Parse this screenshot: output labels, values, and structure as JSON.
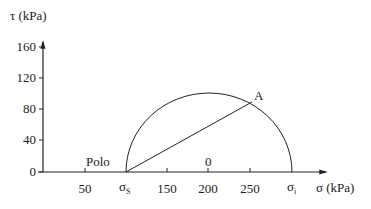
{
  "diagram": {
    "type": "mohr-circle",
    "y_axis": {
      "label": "τ (kPa)",
      "ticks": [
        "0",
        "40",
        "80",
        "120",
        "160"
      ]
    },
    "x_axis": {
      "label": "σ (kPa)",
      "ticks": [
        "50",
        "150",
        "200",
        "250"
      ],
      "special_ticks": {
        "sigma_s": {
          "symbol": "σ",
          "subscript": "S"
        },
        "sigma_i": {
          "symbol": "σ",
          "subscript": "i"
        }
      }
    },
    "labels": {
      "pole": "Polo",
      "point_a": "A",
      "center": "0"
    },
    "circle": {
      "center_sigma": 200,
      "radius": 100,
      "sigma_s": 100,
      "sigma_i": 300
    },
    "line_from_pole_to_A": {
      "from": [
        100,
        0
      ],
      "to": [
        250,
        87
      ]
    }
  }
}
